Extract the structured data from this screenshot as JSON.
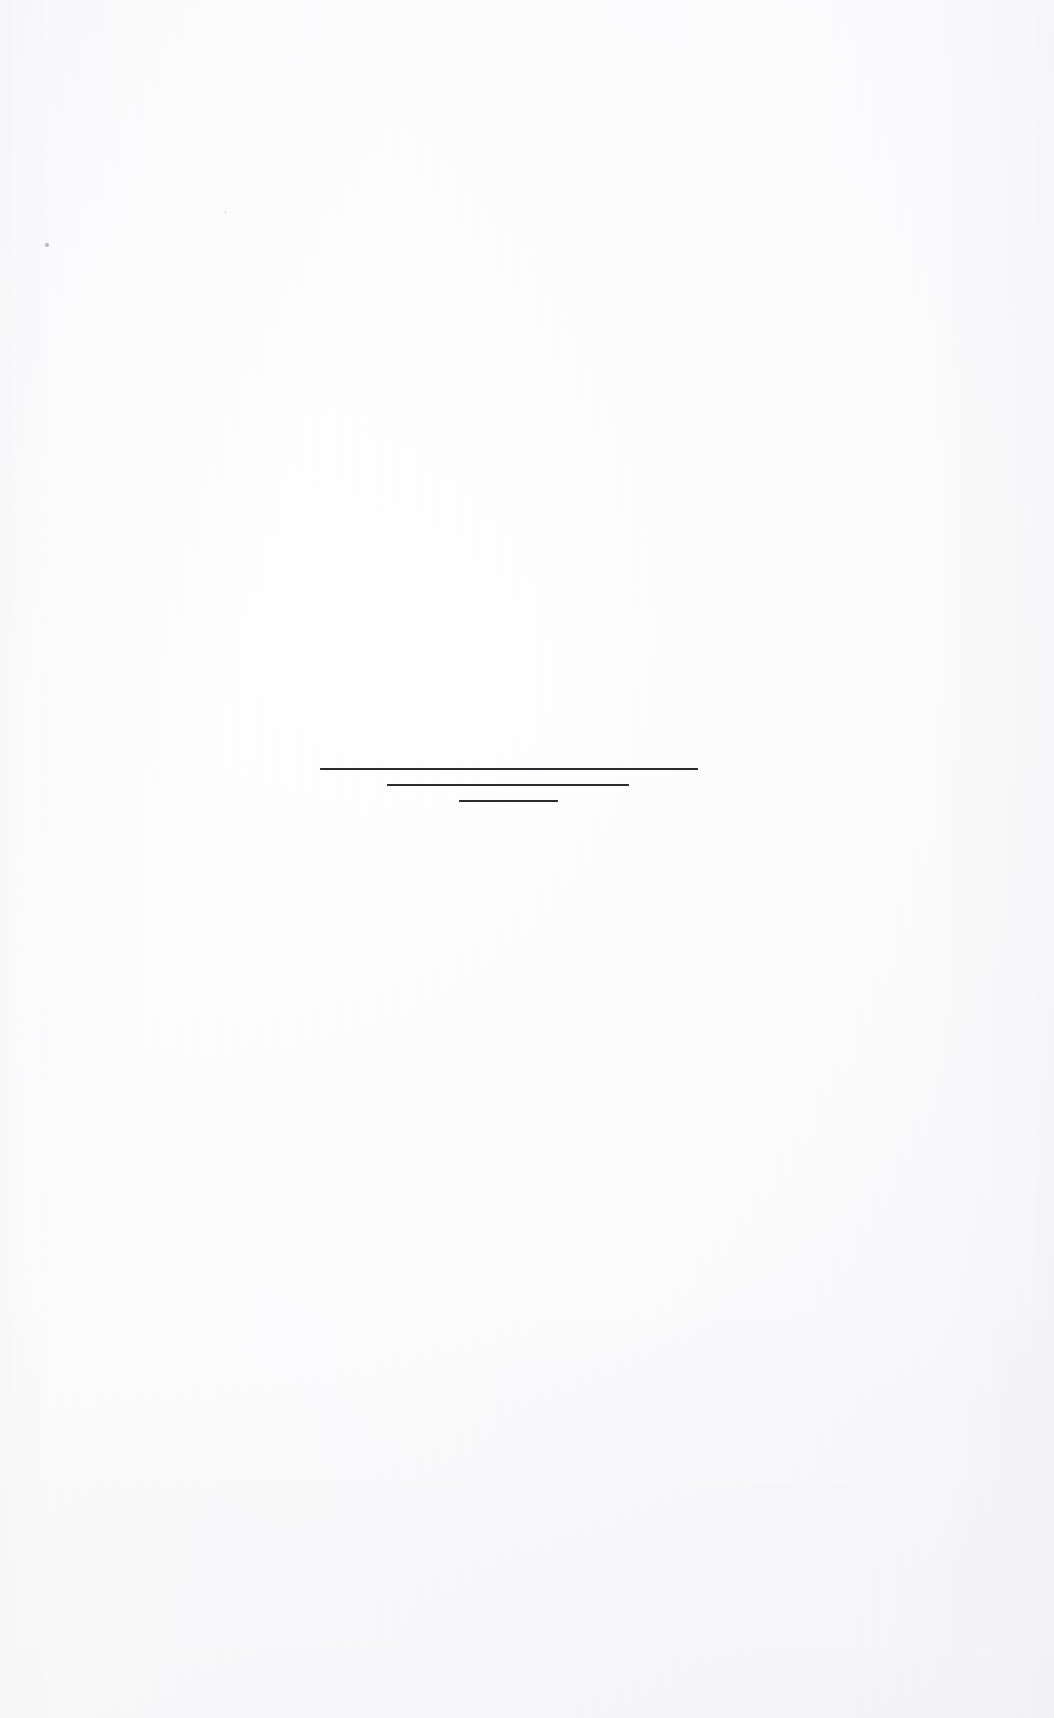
{
  "document": {
    "kind": "scanned-page",
    "page_label": "",
    "body_text": "",
    "background_color": "#fdfdfd",
    "ink_color": "#2b2b30",
    "width": 1054,
    "height": 1718
  },
  "rules": {
    "group_label": "",
    "items": [
      {
        "name": "rule-top",
        "label": "",
        "left": 320,
        "top": 768,
        "width": 378,
        "height": 2
      },
      {
        "name": "rule-middle",
        "label": "",
        "left": 387,
        "top": 784,
        "width": 242,
        "height": 2
      },
      {
        "name": "rule-bottom",
        "label": "",
        "left": 459,
        "top": 800,
        "width": 99,
        "height": 2
      }
    ]
  },
  "artifacts": {
    "speck_main_label": "",
    "speck_faint_label": ""
  }
}
